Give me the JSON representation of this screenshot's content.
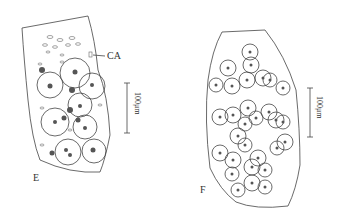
{
  "figure": {
    "panels": [
      {
        "id": "E",
        "label": "E",
        "scale_bar_label": "100μm",
        "annotation": "CA"
      },
      {
        "id": "F",
        "label": "F",
        "scale_bar_label": "100μm"
      }
    ],
    "colors": {
      "ink": "#333333",
      "background": "#ffffff"
    }
  }
}
